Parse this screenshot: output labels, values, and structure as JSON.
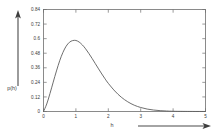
{
  "chart_data": {
    "type": "line",
    "title": "",
    "subtitle": "",
    "xlabel": "h",
    "ylabel": "p(h)",
    "xlim": [
      0,
      5
    ],
    "ylim": [
      0,
      0.84
    ],
    "grid": false,
    "legend": null,
    "x_ticks": [
      "0",
      "1",
      "2",
      "3",
      "4",
      "5"
    ],
    "x_tick_values": [
      0,
      1,
      2,
      3,
      4,
      5
    ],
    "y_ticks": [
      "0",
      "0.12",
      "0.24",
      "0.36",
      "0.48",
      "0.6",
      "0.72",
      "0.84"
    ],
    "y_tick_values": [
      0,
      0.12,
      0.24,
      0.36,
      0.48,
      0.6,
      0.72,
      0.84
    ],
    "series": [
      {
        "name": "p(h)",
        "x": [
          0.0,
          0.1,
          0.2,
          0.3,
          0.4,
          0.5,
          0.6,
          0.7,
          0.8,
          0.9,
          1.0,
          1.1,
          1.2,
          1.3,
          1.4,
          1.5,
          1.6,
          1.7,
          1.8,
          1.9,
          2.0,
          2.2,
          2.4,
          2.6,
          2.8,
          3.0,
          3.2,
          3.4,
          3.6,
          3.8,
          4.0,
          4.3,
          4.6,
          5.0
        ],
        "values": [
          0.0,
          0.062,
          0.148,
          0.242,
          0.334,
          0.418,
          0.487,
          0.538,
          0.57,
          0.584,
          0.585,
          0.572,
          0.548,
          0.516,
          0.478,
          0.437,
          0.394,
          0.351,
          0.309,
          0.269,
          0.232,
          0.169,
          0.118,
          0.08,
          0.052,
          0.033,
          0.02,
          0.012,
          0.007,
          0.004,
          0.002,
          0.001,
          0.0005,
          0.0002
        ]
      }
    ],
    "peak": {
      "x": 1.0,
      "y": 0.585
    },
    "annotations": []
  },
  "decorations": {
    "y_arrow_name": "vertical-up-arrow",
    "x_arrow_name": "horizontal-right-arrow"
  }
}
